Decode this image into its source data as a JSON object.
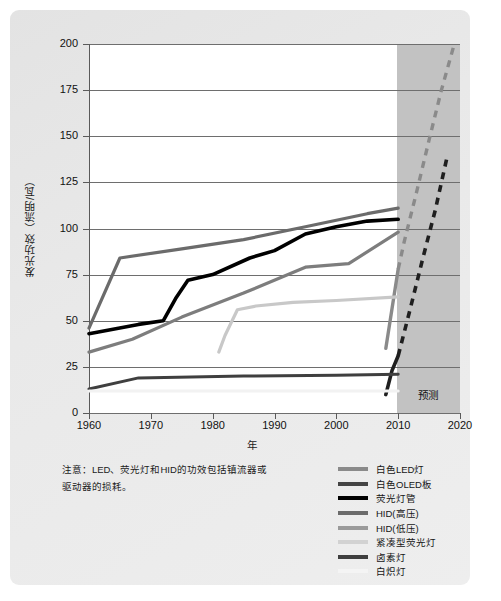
{
  "figure": {
    "note": "注意：LED、荧光灯和HID的功效包括镇流器或驱动器的损耗。",
    "forecast_label": "预测"
  },
  "chart_data": {
    "type": "line",
    "title": "",
    "xlabel": "年",
    "ylabel": "发光功效（流明/瓦）",
    "xlim": [
      1960,
      2020
    ],
    "ylim": [
      0,
      200
    ],
    "xticks": [
      1960,
      1970,
      1980,
      1990,
      2000,
      2010,
      2020
    ],
    "yticks": [
      0,
      25,
      50,
      75,
      100,
      125,
      150,
      175,
      200
    ],
    "grid": true,
    "legend_position": "bottom-right",
    "annotations": [
      {
        "text": "预测",
        "x": 2013,
        "y": 6,
        "note": "shaded forecast region 2010-2020"
      }
    ],
    "shaded_region": {
      "x_start": 2010,
      "x_end": 2020,
      "color": "#c2c2c2"
    },
    "series": [
      {
        "name": "白色LED灯",
        "color": "#8a8a8a",
        "style": "solid+dashed",
        "points": [
          [
            2008,
            35
          ],
          [
            2010,
            78
          ],
          [
            2011,
            93
          ],
          [
            2013,
            120
          ],
          [
            2015,
            148
          ],
          [
            2017,
            175
          ],
          [
            2019,
            199
          ]
        ],
        "dashed_from": 2010
      },
      {
        "name": "白色OLED板",
        "color": "#1f1f1f",
        "style": "solid+dashed",
        "points": [
          [
            2008,
            10
          ],
          [
            2009,
            23
          ],
          [
            2010,
            31
          ],
          [
            2012,
            57
          ],
          [
            2014,
            84
          ],
          [
            2016,
            110
          ],
          [
            2018,
            140
          ]
        ],
        "dashed_from": 2010
      },
      {
        "name": "荧光灯管",
        "color": "#000000",
        "style": "solid",
        "points": [
          [
            1960,
            43
          ],
          [
            1968,
            48
          ],
          [
            1972,
            50
          ],
          [
            1974,
            62
          ],
          [
            1976,
            72
          ],
          [
            1980,
            75
          ],
          [
            1986,
            84
          ],
          [
            1990,
            88
          ],
          [
            1995,
            97
          ],
          [
            2000,
            101
          ],
          [
            2005,
            104
          ],
          [
            2010,
            105
          ]
        ]
      },
      {
        "name": "HID(高压)",
        "color": "#6b6b6b",
        "style": "solid",
        "points": [
          [
            1960,
            46
          ],
          [
            1965,
            84
          ],
          [
            1975,
            89
          ],
          [
            1985,
            94
          ],
          [
            1995,
            101
          ],
          [
            2005,
            108
          ],
          [
            2010,
            111
          ]
        ]
      },
      {
        "name": "HID(低压)",
        "color": "#7d7d7d",
        "style": "solid",
        "points": [
          [
            1960,
            33
          ],
          [
            1967,
            40
          ],
          [
            1975,
            52
          ],
          [
            1985,
            65
          ],
          [
            1995,
            79
          ],
          [
            2002,
            81
          ],
          [
            2010,
            98
          ]
        ]
      },
      {
        "name": "紧凑型荧光灯",
        "color": "#c8c8c8",
        "style": "solid",
        "points": [
          [
            1981,
            33
          ],
          [
            1982,
            42
          ],
          [
            1984,
            56
          ],
          [
            1987,
            58
          ],
          [
            1993,
            60
          ],
          [
            2000,
            61
          ],
          [
            2010,
            63
          ]
        ]
      },
      {
        "name": "卤素灯",
        "color": "#3f3f3f",
        "style": "solid",
        "points": [
          [
            1960,
            13
          ],
          [
            1968,
            19
          ],
          [
            1985,
            20
          ],
          [
            2000,
            20.5
          ],
          [
            2010,
            21
          ]
        ]
      },
      {
        "name": "白炽灯",
        "color": "#f2f2f2",
        "style": "solid",
        "points": [
          [
            1960,
            12
          ],
          [
            1970,
            12
          ],
          [
            1990,
            12
          ],
          [
            2010,
            12
          ]
        ]
      }
    ]
  },
  "legend": {
    "items": [
      {
        "label": "白色LED灯",
        "color": "#8a8a8a"
      },
      {
        "label": "白色OLED板",
        "color": "#444444"
      },
      {
        "label": "荧光灯管",
        "color": "#000000"
      },
      {
        "label": "HID(高压)",
        "color": "#6b6b6b"
      },
      {
        "label": "HID(低压)",
        "color": "#9a9a9a"
      },
      {
        "label": "紧凑型荧光灯",
        "color": "#d2d2d2"
      },
      {
        "label": "卤素灯",
        "color": "#3f3f3f"
      },
      {
        "label": "白炽灯",
        "color": "#f4f4f4"
      }
    ]
  }
}
